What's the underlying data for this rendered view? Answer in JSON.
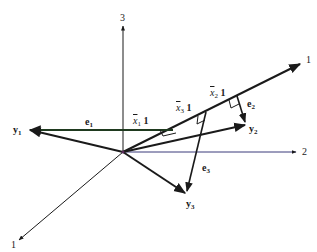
{
  "diagram": {
    "axes": [
      {
        "name": "axis-1",
        "label": "1"
      },
      {
        "name": "axis-2",
        "label": "2"
      },
      {
        "name": "axis-3",
        "label": "3"
      }
    ],
    "unit_vector_label": "1",
    "vectors": {
      "y1": {
        "base": "y",
        "sub": "1"
      },
      "y2": {
        "base": "y",
        "sub": "2"
      },
      "y3": {
        "base": "y",
        "sub": "3"
      }
    },
    "residuals": {
      "e1": {
        "base": "e",
        "sub": "1"
      },
      "e2": {
        "base": "e",
        "sub": "2"
      },
      "e3": {
        "base": "e",
        "sub": "3"
      }
    },
    "projections": {
      "x1": {
        "base": "x",
        "sub": "1",
        "suffix": "1"
      },
      "x2": {
        "base": "x",
        "sub": "2",
        "suffix": "1"
      },
      "x3": {
        "base": "x",
        "sub": "3",
        "suffix": "1"
      }
    },
    "colors": {
      "line": "#1a1a1a",
      "axis2": "#3a3a7a",
      "e1_line": "#1f3a1f"
    }
  }
}
